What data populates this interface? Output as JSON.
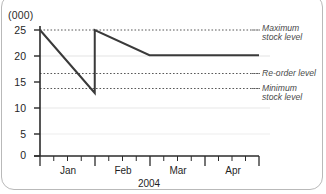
{
  "chart_data": {
    "type": "line",
    "title": "",
    "subtitle": "",
    "unit_label": "(000)",
    "xlabel": "2004",
    "ylabel": "",
    "ylim": [
      0,
      26
    ],
    "yticks": [
      0,
      5,
      10,
      15,
      20,
      25
    ],
    "ytick_labels": [
      "0",
      "5",
      "10",
      "15",
      "20",
      "25"
    ],
    "xlim": [
      0,
      4
    ],
    "xtick_labels": [
      "Jan",
      "Feb",
      "Mar",
      "Apr"
    ],
    "minor_ticks_per_month": 3,
    "grid": "horizontal-faint",
    "legend": "none",
    "series": [
      {
        "name": "Stock level",
        "points": [
          {
            "x": 0.0,
            "y": 25.0
          },
          {
            "x": 1.0,
            "y": 12.5
          },
          {
            "x": 1.0,
            "y": 25.0
          },
          {
            "x": 2.0,
            "y": 20.0
          },
          {
            "x": 4.0,
            "y": 20.0
          }
        ]
      }
    ],
    "reference_lines": [
      {
        "id": "maximum",
        "value": 25.0,
        "label": "Maximum\nstock level",
        "style": "dotted"
      },
      {
        "id": "reorder",
        "value": 15.3,
        "label": "Re-order level",
        "style": "dotted"
      },
      {
        "id": "minimum",
        "value": 12.5,
        "label": "Minimum\nstock level",
        "style": "dotted"
      }
    ],
    "annotations": [
      {
        "id": "maximum-label-line1",
        "text": "Maximum"
      },
      {
        "id": "maximum-label-line2",
        "text": "stock level"
      },
      {
        "id": "reorder-label",
        "text": "Re-order level"
      },
      {
        "id": "minimum-label-line1",
        "text": "Minimum"
      },
      {
        "id": "minimum-label-line2",
        "text": "stock level"
      }
    ],
    "colors": {
      "data_line": "#3a3a3a",
      "axis": "#2b2b2b",
      "reference_line": "#5c5c5c",
      "gridline": "#e2e2e2",
      "annotation_text": "#4a4a4a",
      "frame": "#b9b9b9"
    }
  }
}
